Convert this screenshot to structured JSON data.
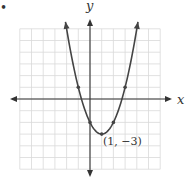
{
  "figure": {
    "marker": "•",
    "axis_labels": {
      "x": "x",
      "y": "y"
    },
    "vertex_label": "(1, −3)",
    "grid": {
      "xmin": -6,
      "xmax": 6,
      "ymin": -6,
      "ymax": 6,
      "unit_px": 11.7
    },
    "colors": {
      "grid": "#d9d9d9",
      "axis": "#333333",
      "curve": "#444444"
    }
  },
  "chart_data": {
    "type": "line",
    "title": "",
    "xlabel": "x",
    "ylabel": "y",
    "equation": "y = (x - 1)^2 - 3",
    "xlim": [
      -6,
      6
    ],
    "ylim": [
      -6,
      6
    ],
    "grid": true,
    "points": [
      {
        "x": -1,
        "y": 1
      },
      {
        "x": 0,
        "y": -2
      },
      {
        "x": 1,
        "y": -3
      },
      {
        "x": 2,
        "y": -2
      },
      {
        "x": 3,
        "y": 1
      }
    ],
    "annotations": [
      {
        "x": 1,
        "y": -3,
        "text": "(1, −3)"
      }
    ]
  }
}
